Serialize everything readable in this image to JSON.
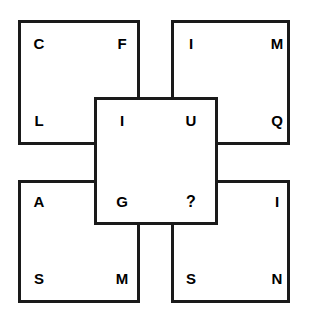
{
  "puzzle": {
    "type": "letter-square-overlap-puzzle",
    "canvas": {
      "width": 309,
      "height": 315,
      "background": "#ffffff"
    },
    "stroke_color": "#1a1a1a",
    "text_color": "#000000",
    "missing_marker": "?",
    "squares": [
      {
        "id": "top-left",
        "name": "top-left-square",
        "x": 18,
        "y": 20,
        "width": 122,
        "height": 125,
        "letters": {
          "tl": "C",
          "tr": "F",
          "bl": "L",
          "br": "I"
        }
      },
      {
        "id": "top-right",
        "name": "top-right-square",
        "x": 171,
        "y": 20,
        "width": 119,
        "height": 125,
        "letters": {
          "tl": "I",
          "tr": "M",
          "bl": "U",
          "br": "Q"
        }
      },
      {
        "id": "bottom-left",
        "name": "bottom-left-square",
        "x": 18,
        "y": 180,
        "width": 122,
        "height": 123,
        "letters": {
          "tl": "A",
          "tr": "G",
          "bl": "S",
          "br": "M"
        }
      },
      {
        "id": "bottom-right",
        "name": "bottom-right-square",
        "x": 171,
        "y": 180,
        "width": 119,
        "height": 123,
        "letters": {
          "tl": "?",
          "tr": "I",
          "bl": "S",
          "br": "N"
        }
      },
      {
        "id": "middle",
        "name": "middle-overlap-square",
        "x": 94,
        "y": 97,
        "width": 124,
        "height": 128,
        "letters": {
          "tl": "I",
          "tr": "U",
          "bl": "G",
          "br": "?"
        }
      }
    ],
    "letters": [
      {
        "key": "tl-c",
        "char": "C",
        "x": 30,
        "y": 36
      },
      {
        "key": "tl-f",
        "char": "F",
        "x": 113,
        "y": 36
      },
      {
        "key": "tl-l",
        "char": "L",
        "x": 30,
        "y": 113
      },
      {
        "key": "mid-i",
        "char": "I",
        "x": 113,
        "y": 113
      },
      {
        "key": "tr-i",
        "char": "I",
        "x": 182,
        "y": 36
      },
      {
        "key": "tr-m",
        "char": "M",
        "x": 268,
        "y": 36
      },
      {
        "key": "mid-u",
        "char": "U",
        "x": 182,
        "y": 113
      },
      {
        "key": "tr-q",
        "char": "Q",
        "x": 268,
        "y": 113
      },
      {
        "key": "bl-a",
        "char": "A",
        "x": 30,
        "y": 194
      },
      {
        "key": "mid-g",
        "char": "G",
        "x": 113,
        "y": 194
      },
      {
        "key": "bl-s",
        "char": "S",
        "x": 30,
        "y": 271
      },
      {
        "key": "bl-m",
        "char": "M",
        "x": 113,
        "y": 271
      },
      {
        "key": "mid-q",
        "char": "?",
        "x": 182,
        "y": 194
      },
      {
        "key": "br-i",
        "char": "I",
        "x": 268,
        "y": 194
      },
      {
        "key": "br-s",
        "char": "S",
        "x": 182,
        "y": 271
      },
      {
        "key": "br-n",
        "char": "N",
        "x": 268,
        "y": 271
      }
    ]
  }
}
